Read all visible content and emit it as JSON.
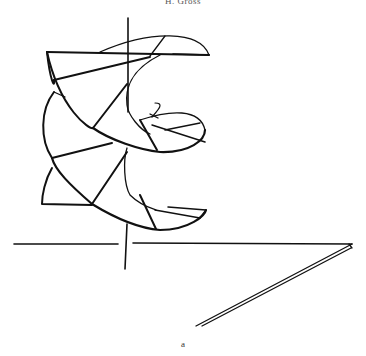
{
  "page": {
    "running_header": "H. Gross",
    "figure": {
      "subject": "helicoid spiral surface with axis and horizontal plane lines",
      "caption_label": "a"
    }
  }
}
